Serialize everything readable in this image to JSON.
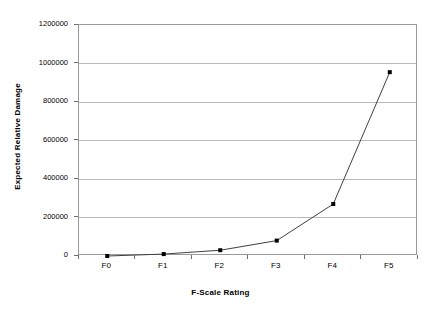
{
  "chart_data": {
    "type": "line",
    "title": "",
    "categories": [
      "F0",
      "F1",
      "F2",
      "F3",
      "F4",
      "F5"
    ],
    "values": [
      0,
      10000,
      30000,
      80000,
      270000,
      955000
    ],
    "series": [
      {
        "name": "Expected Relative Damage",
        "values": [
          0,
          10000,
          30000,
          80000,
          270000,
          955000
        ]
      }
    ],
    "xlabel": "F-Scale Rating",
    "ylabel": "Expected Relative Damage",
    "ylim": [
      0,
      1200000
    ],
    "yticks": [
      0,
      200000,
      400000,
      600000,
      800000,
      1000000,
      1200000
    ],
    "ytick_labels": [
      "0",
      "200000",
      "400000",
      "600000",
      "800000",
      "1000000",
      "1200000"
    ],
    "xtick_labels": [
      "F0",
      "F1",
      "F2",
      "F3",
      "F4",
      "F5"
    ],
    "grid": "horizontal",
    "legend": "none",
    "marker": "square",
    "line_color": "#404040",
    "marker_color": "#000000",
    "grid_color": "#b9b9b9",
    "border_color": "#9a9a9a",
    "background_color": "#ffffff"
  }
}
